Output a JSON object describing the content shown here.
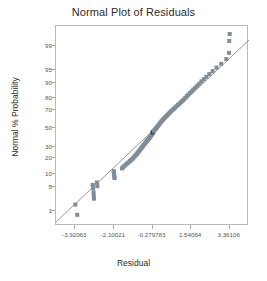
{
  "chart_data": {
    "type": "scatter",
    "title": "Normal Plot of Residuals",
    "xlabel": "Residual",
    "ylabel": "Normal % Probability",
    "grid": false,
    "legend": null,
    "xlim": [
      -4.83084,
      4.27127
    ],
    "ylim_percent": [
      0.3,
      99.8
    ],
    "x_tick_labels": [
      "-3.92063",
      "-2.10021",
      "-0.279783",
      "1.54064",
      "3.36106"
    ],
    "x_tick_values": [
      -3.92063,
      -2.10021,
      -0.279783,
      1.54064,
      3.36106
    ],
    "y_tick_labels": [
      "1",
      "5",
      "10",
      "20",
      "30",
      "50",
      "70",
      "80",
      "90",
      "95",
      "99"
    ],
    "y_tick_values": [
      1,
      5,
      10,
      20,
      30,
      50,
      70,
      80,
      90,
      95,
      99
    ],
    "marker": {
      "shape": "square",
      "size_px": 4,
      "color": "#808c96",
      "highlight_color": "#1d2a4d"
    },
    "reference_line": {
      "color": "#8d8d8d",
      "x1": -4.83084,
      "y1_percent": 0.42,
      "x2": 4.27127,
      "y2_percent": 99.35
    },
    "series": [
      {
        "name": "Residuals",
        "points": [
          {
            "x": -3.92,
            "p": 1.6,
            "highlight": false
          },
          {
            "x": -3.83,
            "p": 0.75,
            "highlight": false
          },
          {
            "x": -3.1,
            "p": 5.6,
            "highlight": false
          },
          {
            "x": -3.08,
            "p": 4.6,
            "highlight": false
          },
          {
            "x": -3.06,
            "p": 3.6,
            "highlight": false
          },
          {
            "x": -3.05,
            "p": 2.9,
            "highlight": false
          },
          {
            "x": -3.04,
            "p": 2.4,
            "highlight": false
          },
          {
            "x": -2.9,
            "p": 6.4,
            "highlight": false
          },
          {
            "x": -2.88,
            "p": 5.2,
            "highlight": false
          },
          {
            "x": -2.11,
            "p": 11.5,
            "highlight": false
          },
          {
            "x": -2.1,
            "p": 10.5,
            "highlight": false
          },
          {
            "x": -2.09,
            "p": 9.6,
            "highlight": false
          },
          {
            "x": -2.08,
            "p": 8.8,
            "highlight": false
          },
          {
            "x": -2.07,
            "p": 8.1,
            "highlight": false
          },
          {
            "x": -1.72,
            "p": 13.0,
            "highlight": false
          },
          {
            "x": -1.66,
            "p": 13.8,
            "highlight": false
          },
          {
            "x": -1.6,
            "p": 14.6,
            "highlight": false
          },
          {
            "x": -1.54,
            "p": 15.4,
            "highlight": false
          },
          {
            "x": -1.47,
            "p": 16.2,
            "highlight": false
          },
          {
            "x": -1.41,
            "p": 17.0,
            "highlight": false
          },
          {
            "x": -1.34,
            "p": 17.9,
            "highlight": false
          },
          {
            "x": -1.28,
            "p": 18.8,
            "highlight": false
          },
          {
            "x": -1.22,
            "p": 19.7,
            "highlight": false
          },
          {
            "x": -1.17,
            "p": 20.6,
            "highlight": false
          },
          {
            "x": -1.12,
            "p": 21.6,
            "highlight": false
          },
          {
            "x": -1.07,
            "p": 22.5,
            "highlight": false
          },
          {
            "x": -1.02,
            "p": 23.5,
            "highlight": false
          },
          {
            "x": -0.98,
            "p": 24.5,
            "highlight": false
          },
          {
            "x": -0.94,
            "p": 25.5,
            "highlight": false
          },
          {
            "x": -0.9,
            "p": 26.5,
            "highlight": false
          },
          {
            "x": -0.86,
            "p": 27.5,
            "highlight": false
          },
          {
            "x": -0.82,
            "p": 28.6,
            "highlight": false
          },
          {
            "x": -0.78,
            "p": 29.6,
            "highlight": false
          },
          {
            "x": -0.74,
            "p": 30.7,
            "highlight": false
          },
          {
            "x": -0.7,
            "p": 31.8,
            "highlight": false
          },
          {
            "x": -0.66,
            "p": 32.9,
            "highlight": false
          },
          {
            "x": -0.62,
            "p": 34.0,
            "highlight": false
          },
          {
            "x": -0.58,
            "p": 35.1,
            "highlight": false
          },
          {
            "x": -0.54,
            "p": 36.2,
            "highlight": false
          },
          {
            "x": -0.5,
            "p": 37.3,
            "highlight": false
          },
          {
            "x": -0.46,
            "p": 38.5,
            "highlight": false
          },
          {
            "x": -0.42,
            "p": 39.6,
            "highlight": false
          },
          {
            "x": -0.38,
            "p": 40.8,
            "highlight": false
          },
          {
            "x": -0.34,
            "p": 42.0,
            "highlight": false
          },
          {
            "x": -0.3,
            "p": 43.2,
            "highlight": false
          },
          {
            "x": -0.28,
            "p": 44.4,
            "highlight": false
          },
          {
            "x": -0.27,
            "p": 45.6,
            "highlight": true
          },
          {
            "x": -0.22,
            "p": 46.8,
            "highlight": false
          },
          {
            "x": -0.18,
            "p": 48.0,
            "highlight": false
          },
          {
            "x": -0.14,
            "p": 49.2,
            "highlight": false
          },
          {
            "x": -0.1,
            "p": 50.4,
            "highlight": false
          },
          {
            "x": -0.06,
            "p": 51.6,
            "highlight": false
          },
          {
            "x": -0.02,
            "p": 52.8,
            "highlight": false
          },
          {
            "x": 0.02,
            "p": 54.0,
            "highlight": false
          },
          {
            "x": 0.06,
            "p": 55.2,
            "highlight": false
          },
          {
            "x": 0.1,
            "p": 56.4,
            "highlight": false
          },
          {
            "x": 0.14,
            "p": 57.6,
            "highlight": false
          },
          {
            "x": 0.18,
            "p": 58.8,
            "highlight": false
          },
          {
            "x": 0.23,
            "p": 60.0,
            "highlight": false
          },
          {
            "x": 0.28,
            "p": 61.2,
            "highlight": false
          },
          {
            "x": 0.33,
            "p": 62.4,
            "highlight": false
          },
          {
            "x": 0.38,
            "p": 63.6,
            "highlight": false
          },
          {
            "x": 0.43,
            "p": 64.8,
            "highlight": false
          },
          {
            "x": 0.48,
            "p": 66.0,
            "highlight": false
          },
          {
            "x": 0.54,
            "p": 67.2,
            "highlight": false
          },
          {
            "x": 0.6,
            "p": 68.4,
            "highlight": false
          },
          {
            "x": 0.66,
            "p": 69.6,
            "highlight": false
          },
          {
            "x": 0.72,
            "p": 70.8,
            "highlight": false
          },
          {
            "x": 0.78,
            "p": 72.0,
            "highlight": false
          },
          {
            "x": 0.85,
            "p": 73.2,
            "highlight": false
          },
          {
            "x": 0.92,
            "p": 74.4,
            "highlight": false
          },
          {
            "x": 0.99,
            "p": 75.6,
            "highlight": false
          },
          {
            "x": 1.06,
            "p": 76.8,
            "highlight": false
          },
          {
            "x": 1.13,
            "p": 78.0,
            "highlight": false
          },
          {
            "x": 1.2,
            "p": 79.2,
            "highlight": false
          },
          {
            "x": 1.27,
            "p": 80.4,
            "highlight": false
          },
          {
            "x": 1.34,
            "p": 81.6,
            "highlight": false
          },
          {
            "x": 1.41,
            "p": 82.8,
            "highlight": false
          },
          {
            "x": 1.49,
            "p": 84.0,
            "highlight": false
          },
          {
            "x": 1.57,
            "p": 85.1,
            "highlight": false
          },
          {
            "x": 1.65,
            "p": 86.2,
            "highlight": false
          },
          {
            "x": 1.74,
            "p": 87.3,
            "highlight": false
          },
          {
            "x": 1.83,
            "p": 88.4,
            "highlight": false
          },
          {
            "x": 1.93,
            "p": 89.5,
            "highlight": false
          },
          {
            "x": 2.03,
            "p": 90.6,
            "highlight": false
          },
          {
            "x": 2.14,
            "p": 91.6,
            "highlight": false
          },
          {
            "x": 2.26,
            "p": 92.6,
            "highlight": false
          },
          {
            "x": 2.4,
            "p": 93.6,
            "highlight": false
          },
          {
            "x": 2.56,
            "p": 94.6,
            "highlight": false
          },
          {
            "x": 2.74,
            "p": 95.6,
            "highlight": false
          },
          {
            "x": 2.96,
            "p": 96.5,
            "highlight": false
          },
          {
            "x": 3.2,
            "p": 97.4,
            "highlight": false
          },
          {
            "x": 3.33,
            "p": 98.3,
            "highlight": false
          },
          {
            "x": 3.34,
            "p": 99.3,
            "highlight": false
          },
          {
            "x": 3.36,
            "p": 99.6,
            "highlight": false
          }
        ]
      }
    ]
  }
}
